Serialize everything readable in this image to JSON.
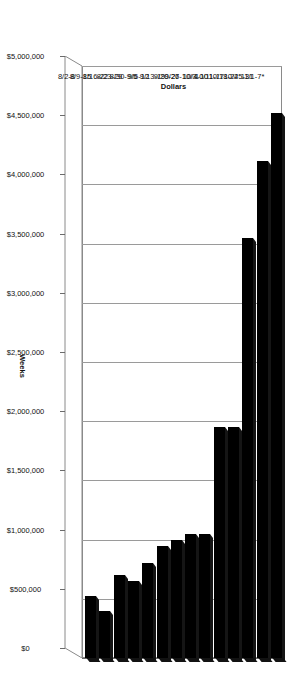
{
  "chart_data": {
    "type": "bar",
    "orientation": "horizontal-3d",
    "title": "",
    "xlabel": "Weeks",
    "ylabel": "Dollars",
    "ylim": [
      0,
      5000000
    ],
    "grid": true,
    "legend": "none",
    "categories": [
      "8/2-8",
      "8/9-15",
      "8/16-22",
      "8/23-29",
      "8/30-9/5",
      "9/6-12",
      "9/13-19",
      "9/20-26",
      "9/27-10/3",
      "10/4-10",
      "10/11-17",
      "10/18-24",
      "10/25-31",
      "11/1-7*"
    ],
    "values": [
      520000,
      400000,
      700000,
      650000,
      800000,
      950000,
      1000000,
      1050000,
      1050000,
      1950000,
      1950000,
      3550000,
      4200000,
      4600000
    ],
    "value_tick_labels": [
      "$0",
      "$500,000",
      "$1,000,000",
      "$1,500,000",
      "$2,000,000",
      "$2,500,000",
      "$3,000,000",
      "$3,500,000",
      "$4,000,000",
      "$4,500,000",
      "$5,000,000"
    ],
    "value_ticks": [
      0,
      500000,
      1000000,
      1500000,
      2000000,
      2500000,
      3000000,
      3500000,
      4000000,
      4500000,
      5000000
    ],
    "footnote_marker": "*",
    "series_color": "#000000"
  }
}
